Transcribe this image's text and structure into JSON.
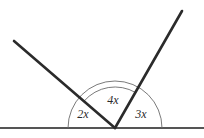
{
  "figure": {
    "kind": "geometry-angle-diagram",
    "background_color": "#ffffff",
    "stroke_color": "#2b2b2b",
    "arc_color": "#6b6b6b",
    "baseline_color": "#555555",
    "vertex": {
      "x": 115,
      "y": 128
    },
    "baseline": {
      "x1": 0,
      "y1": 128,
      "x2": 204,
      "y2": 128,
      "width": 2
    },
    "rays": [
      {
        "name": "left-ray",
        "from_x": 115,
        "from_y": 128,
        "to_x": 14,
        "to_y": 41,
        "width": 2.6,
        "angle_degrees": 139
      },
      {
        "name": "right-ray",
        "from_x": 115,
        "from_y": 128,
        "to_x": 182,
        "to_y": 11,
        "width": 2.6,
        "angle_degrees": 60
      }
    ],
    "arcs": [
      {
        "name": "outer-arc",
        "radius": 47,
        "start_degrees": 0,
        "end_degrees": 180,
        "width": 0.9,
        "path": "M 162 128 A 47 47 0 0 0 68 128"
      },
      {
        "name": "inner-arc",
        "radius": 41,
        "start_degrees": 60,
        "end_degrees": 139,
        "width": 0.9,
        "path": "M 135.5 92.5 A 41 41 0 0 0 84.1 101.1"
      }
    ],
    "labels": [
      {
        "id": "label-2x",
        "text": "2x",
        "x": 83,
        "y": 115,
        "region": "left"
      },
      {
        "id": "label-4x",
        "text": "4x",
        "x": 113,
        "y": 101,
        "region": "middle"
      },
      {
        "id": "label-3x",
        "text": "3x",
        "x": 141,
        "y": 115,
        "region": "right"
      }
    ]
  }
}
